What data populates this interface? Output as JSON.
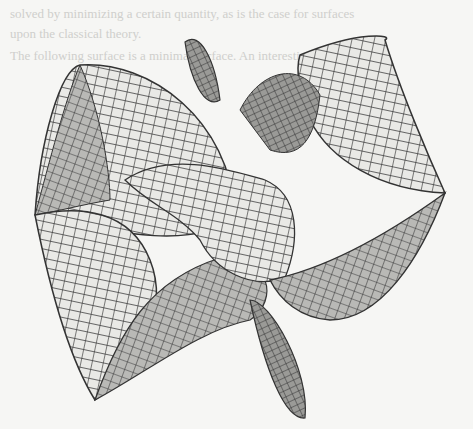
{
  "figure": {
    "background_color": "#f6f6f4",
    "mesh_line_color": "#3a3a3a",
    "light_face_color": "#e9e9e6",
    "dark_face_color": "#8d8d8b"
  },
  "bleed_through_text": [
    "solved by minimizing a certain quantity, as is the case for surfaces",
    "upon the classical theory.",
    "The following surface is a minimal surface. An interesting"
  ]
}
